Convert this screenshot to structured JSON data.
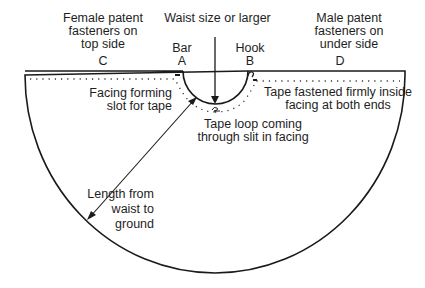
{
  "labels": {
    "female_fasteners": [
      "Female patent",
      "fasteners on",
      "top side"
    ],
    "male_fasteners": [
      "Male patent",
      "fasteners on",
      "under side"
    ],
    "waist_size": "Waist size or larger",
    "bar": "Bar",
    "hook": "Hook",
    "point_a": "A",
    "point_b": "B",
    "point_c": "C",
    "point_d": "D",
    "facing_slot": [
      "Facing forming",
      "slot for tape"
    ],
    "tape_fastened": [
      "Tape fastened firmly inside",
      "facing at  both ends"
    ],
    "tape_loop": [
      "Tape loop coming",
      "through slit in facing"
    ],
    "length": [
      "Length from",
      "waist to",
      "ground"
    ]
  },
  "colors": {
    "line": "#1a1a1a",
    "background": "#ffffff"
  }
}
